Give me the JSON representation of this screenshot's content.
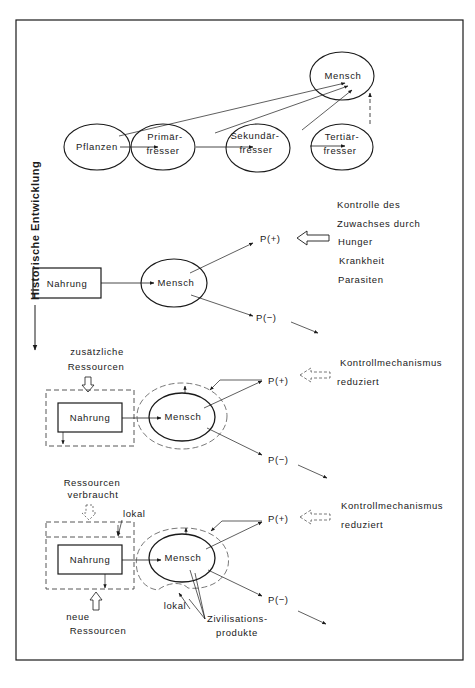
{
  "diagram": {
    "side_label": "Historische Entwicklung",
    "colors": {
      "ink": "#1a1a1a",
      "dashed": "#555555",
      "background": "#ffffff"
    },
    "section1": {
      "nodes": {
        "pflanzen": "Pflanzen",
        "primaer_1": "Primär-",
        "primaer_2": "fresser",
        "sekundaer_1": "Sekundär-",
        "sekundaer_2": "fresser",
        "tertiaer_1": "Tertiär-",
        "tertiaer_2": "fresser",
        "mensch": "Mensch"
      }
    },
    "section2": {
      "nahrung": "Nahrung",
      "mensch": "Mensch",
      "p_plus": "P(+)",
      "p_minus": "P(−)",
      "control_text": [
        "Kontrolle des",
        "Zuwachses durch",
        "Hunger",
        "Krankheit",
        "Parasiten"
      ]
    },
    "section3": {
      "resources_1": "zusätzliche",
      "resources_2": "Ressourcen",
      "nahrung": "Nahrung",
      "mensch": "Mensch",
      "p_plus": "P(+)",
      "p_minus": "P(−)",
      "control_1": "Kontrollmechanismus",
      "control_2": "reduziert"
    },
    "section4": {
      "used_1": "Ressourcen",
      "used_2": "verbraucht",
      "lokal_top": "lokal",
      "nahrung": "Nahrung",
      "new_1": "neue",
      "new_2": "Ressourcen",
      "mensch": "Mensch",
      "p_plus": "P(+)",
      "p_minus": "P(−)",
      "lokal_bottom": "lokal",
      "products_1": "Zivilisations-",
      "products_2": "produkte",
      "control_1": "Kontrollmechanismus",
      "control_2": "reduziert"
    }
  }
}
